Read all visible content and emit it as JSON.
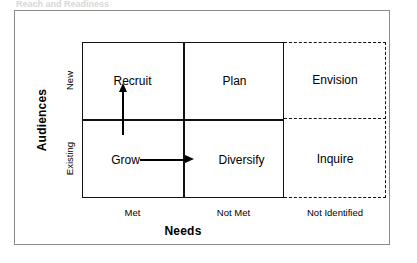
{
  "figure": {
    "top_caption": "Reach and Readiness",
    "y_axis_title": "Audiences",
    "x_axis_title": "Needs",
    "row_labels": [
      "New",
      "Existing"
    ],
    "column_labels": [
      "Met",
      "Not Met",
      "Not Identified"
    ],
    "cells": [
      {
        "id": "recruit",
        "label": "Recruit",
        "row": "New",
        "column": "Met",
        "style": "solid"
      },
      {
        "id": "plan",
        "label": "Plan",
        "row": "New",
        "column": "Not Met",
        "style": "solid"
      },
      {
        "id": "envision",
        "label": "Envision",
        "row": "New",
        "column": "Not Identified",
        "style": "dashed"
      },
      {
        "id": "grow",
        "label": "Grow",
        "row": "Existing",
        "column": "Met",
        "style": "solid"
      },
      {
        "id": "diversify",
        "label": "Diversify",
        "row": "Existing",
        "column": "Not Met",
        "style": "solid"
      },
      {
        "id": "inquire",
        "label": "Inquire",
        "row": "Existing",
        "column": "Not Identified",
        "style": "dashed"
      }
    ],
    "arrows": [
      {
        "id": "grow-to-recruit",
        "direction": "up",
        "from": "Grow",
        "to": "Recruit"
      },
      {
        "id": "grow-to-diversify",
        "direction": "right",
        "from": "Grow",
        "to": "Diversify"
      }
    ],
    "colors": {
      "line": "#111111",
      "text": "#000000",
      "frame": "#8a8a8a",
      "background": "#ffffff"
    }
  }
}
